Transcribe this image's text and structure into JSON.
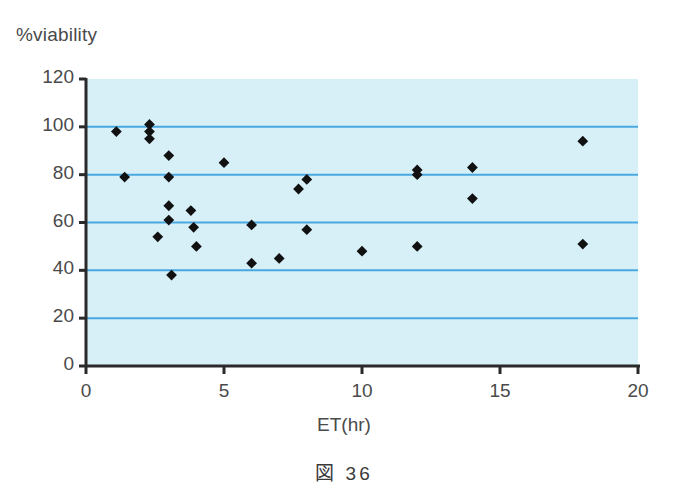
{
  "figure": {
    "caption": "図 36",
    "y_axis_title": "%viability",
    "x_axis_title": "ET(hr)"
  },
  "colors": {
    "plot_background": "#d7f0f8",
    "gridline": "#4aa8e0",
    "axis": "#2a2a2a",
    "marker": "#111111",
    "text": "#4a4a4a",
    "page_background": "#ffffff"
  },
  "chart_data": {
    "type": "scatter",
    "title": "図 36",
    "xlabel": "ET(hr)",
    "ylabel": "%viability",
    "xlim": [
      0,
      20
    ],
    "ylim": [
      0,
      120
    ],
    "xticks": [
      0,
      5,
      10,
      15,
      20
    ],
    "yticks": [
      0,
      20,
      40,
      60,
      80,
      100,
      120
    ],
    "xtick_labels": [
      "0",
      "5",
      "10",
      "15",
      "20"
    ],
    "ytick_labels": [
      "0",
      "20",
      "40",
      "60",
      "80",
      "100",
      "120"
    ],
    "grid": "horizontal",
    "gridlines_at": [
      20,
      40,
      60,
      80,
      100
    ],
    "legend": null,
    "marker": "diamond",
    "series": [
      {
        "name": "viability",
        "points": [
          {
            "x": 1.1,
            "y": 98
          },
          {
            "x": 1.4,
            "y": 79
          },
          {
            "x": 2.3,
            "y": 101
          },
          {
            "x": 2.3,
            "y": 98
          },
          {
            "x": 2.3,
            "y": 95
          },
          {
            "x": 2.6,
            "y": 54
          },
          {
            "x": 3.0,
            "y": 88
          },
          {
            "x": 3.0,
            "y": 79
          },
          {
            "x": 3.0,
            "y": 67
          },
          {
            "x": 3.0,
            "y": 61
          },
          {
            "x": 3.1,
            "y": 38
          },
          {
            "x": 3.8,
            "y": 65
          },
          {
            "x": 3.9,
            "y": 58
          },
          {
            "x": 4.0,
            "y": 50
          },
          {
            "x": 5.0,
            "y": 85
          },
          {
            "x": 6.0,
            "y": 59
          },
          {
            "x": 6.0,
            "y": 43
          },
          {
            "x": 7.0,
            "y": 45
          },
          {
            "x": 7.7,
            "y": 74
          },
          {
            "x": 8.0,
            "y": 78
          },
          {
            "x": 8.0,
            "y": 57
          },
          {
            "x": 10.0,
            "y": 48
          },
          {
            "x": 12.0,
            "y": 82
          },
          {
            "x": 12.0,
            "y": 80
          },
          {
            "x": 12.0,
            "y": 50
          },
          {
            "x": 14.0,
            "y": 83
          },
          {
            "x": 14.0,
            "y": 70
          },
          {
            "x": 18.0,
            "y": 94
          },
          {
            "x": 18.0,
            "y": 51
          }
        ]
      }
    ]
  },
  "geometry": {
    "plot_left": 86,
    "plot_right": 638,
    "plot_top": 79,
    "plot_bottom": 366
  }
}
